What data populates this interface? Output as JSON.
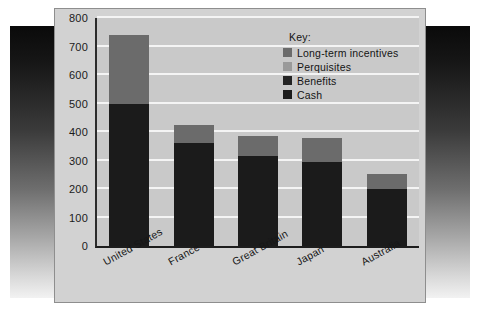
{
  "chart_data": {
    "type": "bar",
    "subtype": "stacked",
    "title": "",
    "xlabel": "",
    "ylabel": "",
    "ylim": [
      0,
      800
    ],
    "yticks": [
      0,
      100,
      200,
      300,
      400,
      500,
      600,
      700,
      800
    ],
    "grid": true,
    "legend_position": "inside-top-right",
    "legend_title": "Key:",
    "categories": [
      "United States",
      "France",
      "Great Britain",
      "Japan",
      "Australia"
    ],
    "series": [
      {
        "name": "Cash",
        "color": "#1b1b1b",
        "values": [
          500,
          360,
          315,
          295,
          200
        ]
      },
      {
        "name": "Benefits",
        "color": "#232323",
        "values": [
          0,
          0,
          0,
          0,
          0
        ]
      },
      {
        "name": "Perquisites",
        "color": "#9a9a9a",
        "values": [
          0,
          0,
          0,
          0,
          0
        ]
      },
      {
        "name": "Long-term incentives",
        "color": "#6b6b6b",
        "values": [
          240,
          65,
          70,
          83,
          52
        ]
      }
    ],
    "totals": [
      740,
      425,
      385,
      378,
      252
    ]
  },
  "legend": {
    "title": "Key:",
    "items": [
      {
        "label": "Long-term incentives",
        "color": "#6b6b6b"
      },
      {
        "label": "Perquisites",
        "color": "#9a9a9a"
      },
      {
        "label": "Benefits",
        "color": "#232323"
      },
      {
        "label": "Cash",
        "color": "#1b1b1b"
      }
    ]
  },
  "colors": {
    "panel_background": "#d2d2d2",
    "plot_background": "#c9c9c9",
    "gridline": "#f4f4f4",
    "axis": "#1d1d1d",
    "text": "#161616"
  }
}
